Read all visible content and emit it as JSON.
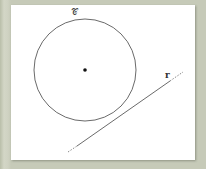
{
  "figure": {
    "circle_label": "𝒞",
    "line_label": "r",
    "colors": {
      "background": "#c9cdbe",
      "panel": "#ffffff",
      "stroke": "#333333"
    },
    "circle": {
      "cx": 85,
      "cy": 70,
      "r": 51
    },
    "center_point": {
      "cx": 85,
      "cy": 70
    },
    "line": {
      "x1": 68,
      "y1": 152,
      "x2": 183,
      "y2": 72
    }
  }
}
